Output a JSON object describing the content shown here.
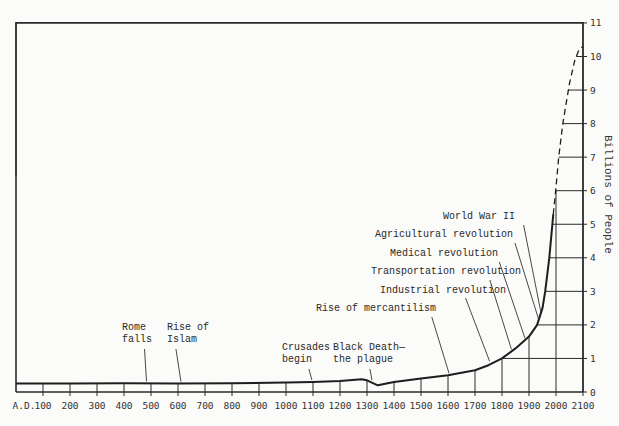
{
  "chart_data": {
    "type": "line",
    "title": "",
    "xlabel": "",
    "ylabel": "Billions of People",
    "x_tick_labels": [
      "A.D.",
      "100",
      "200",
      "300",
      "400",
      "500",
      "600",
      "700",
      "800",
      "900",
      "1000",
      "1100",
      "1200",
      "1300",
      "1400",
      "1500",
      "1600",
      "1700",
      "1800",
      "1900",
      "2000",
      "2100"
    ],
    "y_tick_labels": [
      "0",
      "1",
      "2",
      "3",
      "4",
      "5",
      "6",
      "7",
      "8",
      "9",
      "10",
      "11"
    ],
    "xlim": [
      0,
      2100
    ],
    "ylim": [
      0,
      11
    ],
    "grid": "partial (right-hand region above 1800)",
    "series": [
      {
        "name": "World population (historical)",
        "style": "solid",
        "x": [
          0,
          200,
          400,
          600,
          800,
          1000,
          1100,
          1200,
          1280,
          1300,
          1340,
          1400,
          1500,
          1600,
          1700,
          1750,
          1800,
          1850,
          1900,
          1930,
          1950,
          1960,
          1975,
          1990
        ],
        "y": [
          0.25,
          0.25,
          0.26,
          0.25,
          0.26,
          0.28,
          0.3,
          0.33,
          0.38,
          0.35,
          0.2,
          0.3,
          0.4,
          0.5,
          0.65,
          0.8,
          1.0,
          1.3,
          1.65,
          2.0,
          2.5,
          3.0,
          4.0,
          5.3
        ]
      },
      {
        "name": "World population (projected)",
        "style": "dashed",
        "x": [
          1990,
          2000,
          2010,
          2025,
          2050,
          2070,
          2085,
          2100
        ],
        "y": [
          5.3,
          6.1,
          7.0,
          8.0,
          9.2,
          9.9,
          10.2,
          10.3
        ]
      }
    ],
    "annotations": [
      {
        "text": [
          "Rome",
          "falls"
        ],
        "year": 476
      },
      {
        "text": [
          "Rise of",
          "Islam"
        ],
        "year": 622
      },
      {
        "text": [
          "Crusades",
          "begin"
        ],
        "year": 1096
      },
      {
        "text": [
          "Black Death—",
          "the plague"
        ],
        "year": 1348
      },
      {
        "text": [
          "Rise of mercantilism"
        ],
        "year": 1600
      },
      {
        "text": [
          "Industrial revolution"
        ],
        "year": 1760
      },
      {
        "text": [
          "Transportation revolution"
        ],
        "year": 1830
      },
      {
        "text": [
          "Medical revolution"
        ],
        "year": 1880
      },
      {
        "text": [
          "Agricultural revolution"
        ],
        "year": 1940
      },
      {
        "text": [
          "World War II"
        ],
        "year": 1945
      }
    ]
  }
}
